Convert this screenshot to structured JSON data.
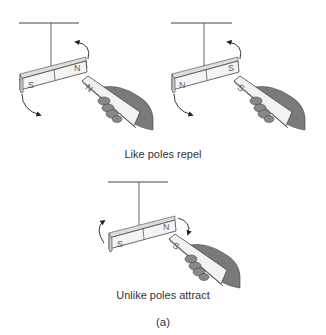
{
  "figure": {
    "top_cropped_text": "(a) Magnets: like and unlike poles with a suspended bar magnet...",
    "panels": [
      {
        "id": "like-ns",
        "suspended_magnet": {
          "left_pole": "S",
          "right_pole": "N"
        },
        "handheld_magnet": {
          "facing_pole": "N"
        },
        "rotation": "repel"
      },
      {
        "id": "like-sn",
        "suspended_magnet": {
          "left_pole": "N",
          "right_pole": "S"
        },
        "handheld_magnet": {
          "facing_pole": "S"
        },
        "rotation": "repel"
      },
      {
        "id": "unlike",
        "suspended_magnet": {
          "left_pole": "S",
          "right_pole": "N"
        },
        "handheld_magnet": {
          "facing_pole": "S"
        },
        "rotation": "attract"
      }
    ],
    "captions": {
      "repel": "Like poles repel",
      "attract": "Unlike poles attract",
      "label": "(a)"
    },
    "colors": {
      "magnet_face": "#f4f4f4",
      "magnet_side": "#c8c8c8",
      "hand": "#7a7a7a",
      "hand_dark": "#555555",
      "line": "#333333"
    }
  }
}
